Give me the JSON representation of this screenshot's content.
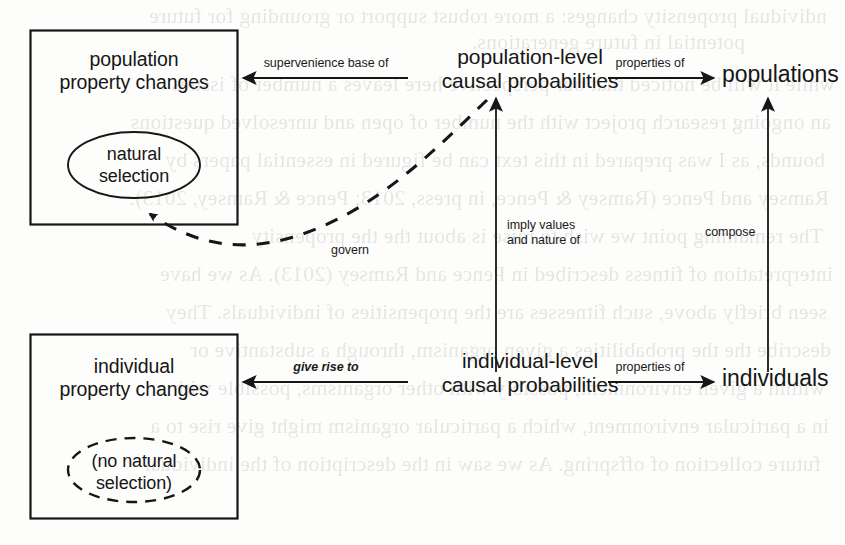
{
  "diagram": {
    "background_color": "#fdfdfc",
    "ink_color": "#161616",
    "boxes": [
      {
        "id": "population-property-changes",
        "label_line1": "population",
        "label_line2": "property changes",
        "ellipse_line1": "natural",
        "ellipse_line2": "selection",
        "ellipse_style": "solid"
      },
      {
        "id": "individual-property-changes",
        "label_line1": "individual",
        "label_line2": "property changes",
        "ellipse_line1": "(no natural",
        "ellipse_line2": "selection)",
        "ellipse_style": "dashed"
      }
    ],
    "nodes": [
      {
        "id": "population-level-causal-probabilities",
        "line1": "population-level",
        "line2": "causal probabilities"
      },
      {
        "id": "individual-level-causal-probabilities",
        "line1": "individual-level",
        "line2": "causal probabilities"
      },
      {
        "id": "populations",
        "line1": "populations"
      },
      {
        "id": "individuals",
        "line1": "individuals"
      }
    ],
    "edges": [
      {
        "id": "supervenience-base-of",
        "label": "supervenience base of",
        "style": "solid",
        "italic": false,
        "direction": "right-to-left"
      },
      {
        "id": "properties-of-populations",
        "label": "properties of",
        "style": "solid",
        "italic": false,
        "direction": "left-to-right"
      },
      {
        "id": "give-rise-to",
        "label": "give rise to",
        "style": "solid",
        "italic": true,
        "direction": "right-to-left"
      },
      {
        "id": "properties-of-individuals",
        "label": "properties of",
        "style": "solid",
        "italic": false,
        "direction": "left-to-right"
      },
      {
        "id": "imply-values-and-nature-of",
        "label_line1": "imply values",
        "label_line2": "and nature of",
        "style": "solid",
        "italic": false,
        "direction": "bottom-to-top"
      },
      {
        "id": "compose",
        "label": "compose",
        "style": "solid",
        "italic": false,
        "direction": "bottom-to-top"
      },
      {
        "id": "govern",
        "label": "govern",
        "style": "dashed",
        "italic": false,
        "direction": "right-to-left-curved"
      }
    ]
  },
  "bleed_text": {
    "lines": [
      "ndividual propensity changes: a more robust support or grounding for future",
      "potential in future generations.",
      "while it will be noticed that our perspective here leaves a number of issues",
      "an ongoing research project with the number of open and unresolved questions",
      "bounds, as I was prepared in this text can be figured in essential papers by",
      "Ramsey and Pence (Ramsey & Pence, in press, 2013; Pence & Ramsey, 2013).",
      "The remaining point we wish to raise is about the the propensity",
      "interpretation of fitness described in Pence and Ramsey (2013). As we have",
      "seen briefly above, such fitnesses are the propensities of individuals. They",
      "describe the the probabilities a given organism, through a substantive or",
      "within a given environment, possibly with other organisms, possible with a",
      "in a particular environment, which a particular organism might give rise to a",
      "future collection of offspring. As we saw in the description of the individual"
    ]
  }
}
